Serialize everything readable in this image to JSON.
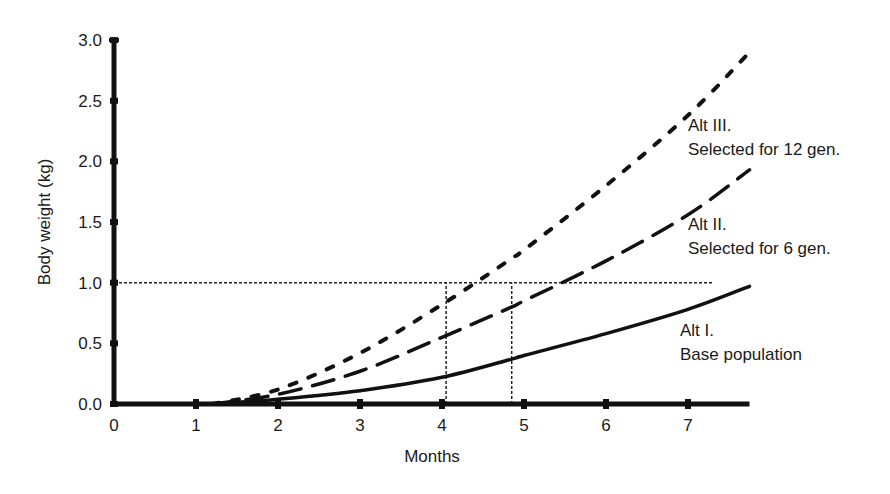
{
  "chart_data": {
    "type": "line",
    "title": "",
    "xlabel": "Months",
    "ylabel": "Body weight (kg)",
    "xlim": [
      0,
      7.75
    ],
    "ylim": [
      0,
      3.0
    ],
    "x_ticks": [
      "0",
      "1",
      "2",
      "3",
      "4",
      "5",
      "6",
      "7"
    ],
    "y_ticks": [
      "0.0",
      "0.5",
      "1.0",
      "1.5",
      "2.0",
      "2.5",
      "3.0"
    ],
    "grid": false,
    "legend": "inline annotations",
    "x": [
      1.2,
      2,
      3,
      4,
      4.85,
      5,
      6,
      7,
      7.75
    ],
    "series": [
      {
        "name": "Alt I. Base population",
        "style": "solid",
        "values": [
          0.0,
          0.04,
          0.11,
          0.22,
          0.37,
          0.4,
          0.58,
          0.78,
          0.97
        ]
      },
      {
        "name": "Alt II. Selected for 6 gen.",
        "style": "long-dash",
        "values": [
          0.0,
          0.08,
          0.27,
          0.55,
          0.8,
          0.85,
          1.18,
          1.56,
          1.93
        ]
      },
      {
        "name": "Alt III. Selected for 12 gen.",
        "style": "short-dash",
        "values": [
          0.0,
          0.12,
          0.42,
          0.82,
          1.2,
          1.27,
          1.8,
          2.38,
          2.9
        ]
      }
    ],
    "reference_lines": [
      {
        "type": "horizontal",
        "y": 1.0,
        "x_from": 0,
        "x_to": 7.3,
        "style": "dotted"
      },
      {
        "type": "vertical",
        "x": 4.05,
        "y_from": 0,
        "y_to": 1.0,
        "style": "dotted"
      },
      {
        "type": "vertical",
        "x": 4.85,
        "y_from": 0,
        "y_to": 1.0,
        "style": "dotted"
      }
    ],
    "annotations": [
      {
        "line1": "Alt III.",
        "line2": "Selected for 12 gen."
      },
      {
        "line1": "Alt II.",
        "line2": "Selected for 6 gen."
      },
      {
        "line1": "Alt I.",
        "line2": "Base population"
      }
    ]
  }
}
